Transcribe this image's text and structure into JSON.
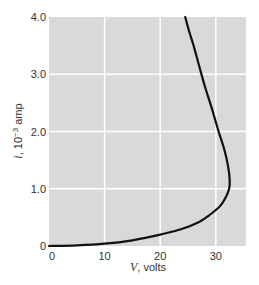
{
  "chart_data": {
    "type": "line",
    "title": "",
    "xlabel": "V, volts",
    "xlabel_var": "V",
    "xlabel_unit": ", volts",
    "ylabel": "i, 10^-3 amp",
    "ylabel_var": "i",
    "ylabel_unit": ", 10",
    "ylabel_exp": "−3",
    "ylabel_tail": " amp",
    "xlim": [
      0,
      35
    ],
    "ylim": [
      0,
      4.0
    ],
    "x_ticks": [
      0,
      10,
      20,
      30
    ],
    "x_tick_labels": [
      "0",
      "10",
      "20",
      "30"
    ],
    "y_ticks": [
      0,
      1.0,
      2.0,
      3.0,
      4.0
    ],
    "y_tick_labels": [
      "0",
      "1.0",
      "2.0",
      "3.0",
      "4.0"
    ],
    "grid": true,
    "legend": null,
    "background": "#d9d9d9",
    "grid_color": "#ffffff",
    "line_color": "#111111",
    "series": [
      {
        "name": "i-V characteristic",
        "x": [
          0,
          5,
          10,
          15,
          20,
          24,
          27,
          29,
          30.8,
          31.8,
          32.4,
          32.5,
          32.2,
          31.5,
          30.5,
          29.3,
          28,
          27,
          26,
          25.2,
          24.5
        ],
        "y": [
          0,
          0.01,
          0.04,
          0.1,
          0.2,
          0.3,
          0.42,
          0.55,
          0.7,
          0.85,
          1.0,
          1.15,
          1.4,
          1.7,
          2.0,
          2.4,
          2.8,
          3.15,
          3.5,
          3.75,
          4.0
        ]
      }
    ]
  }
}
